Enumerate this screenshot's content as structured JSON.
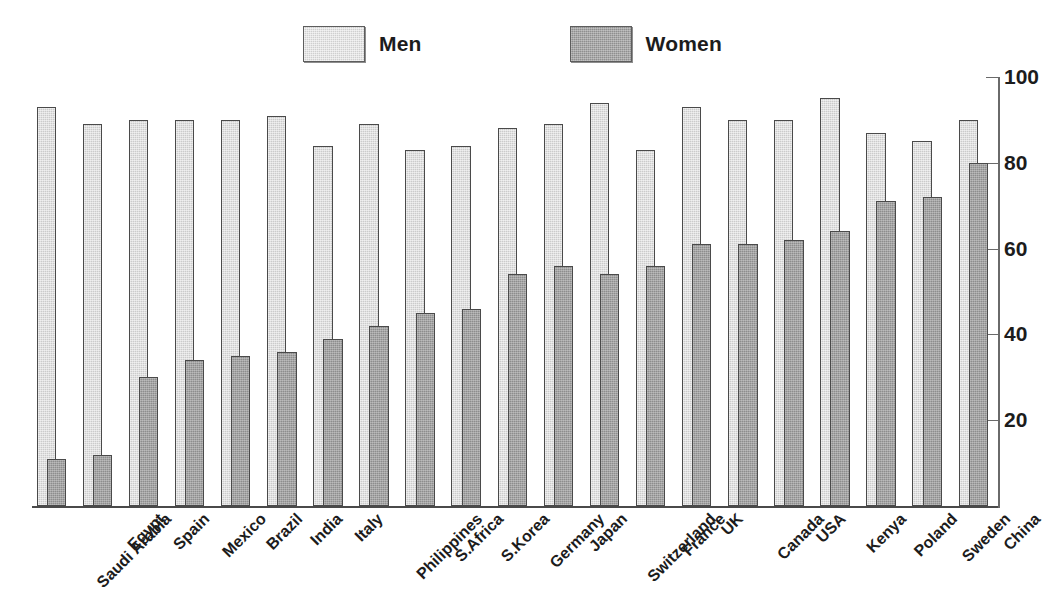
{
  "legend": {
    "items": [
      {
        "label": "Men",
        "color": "#cbcbcb",
        "key": "men"
      },
      {
        "label": "Women",
        "color": "#8d8d8d",
        "key": "women"
      }
    ]
  },
  "axis": {
    "y_ticks": [
      "100",
      "80",
      "60",
      "40",
      "20"
    ],
    "y_tick_values": [
      100,
      80,
      60,
      40,
      20
    ]
  },
  "chart_data": {
    "type": "bar",
    "title": "",
    "subtitle": "",
    "xlabel": "",
    "ylabel": "",
    "ylim": [
      0,
      100
    ],
    "grid": false,
    "legend_position": "top-center",
    "orientation": "vertical",
    "categories": [
      "Saudi Arabia",
      "Egypt",
      "Spain",
      "Mexico",
      "Brazil",
      "India",
      "Italy",
      "Philippines",
      "S.Africa",
      "S.Korea",
      "Germany",
      "Japan",
      "Switzerland",
      "France",
      "UK",
      "Canada",
      "USA",
      "Kenya",
      "Poland",
      "Sweden",
      "China"
    ],
    "series": [
      {
        "name": "Men",
        "color": "#cbcbcb",
        "values": [
          93,
          89,
          90,
          90,
          90,
          91,
          84,
          89,
          83,
          84,
          88,
          89,
          94,
          83,
          93,
          90,
          90,
          95,
          87,
          85,
          90
        ]
      },
      {
        "name": "Women",
        "color": "#8d8d8d",
        "values": [
          11,
          12,
          30,
          34,
          35,
          36,
          39,
          42,
          45,
          46,
          54,
          56,
          54,
          56,
          61,
          61,
          62,
          64,
          71,
          72,
          80
        ]
      }
    ]
  }
}
